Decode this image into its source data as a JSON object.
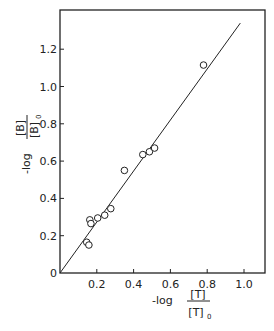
{
  "chart_data": {
    "type": "scatter",
    "title": "",
    "xlabel": "-log [T]/[T]0",
    "ylabel": "-log [B]/[B]0",
    "xlabel_parts": {
      "prefix": "-log",
      "numerator": "[T]",
      "denominator": "[T]",
      "subscript": "0"
    },
    "ylabel_parts": {
      "prefix": "-log",
      "numerator": "[B]",
      "denominator": "[B]",
      "subscript": "0"
    },
    "xlim": [
      0,
      1.1
    ],
    "ylim": [
      0,
      1.38
    ],
    "x_ticks": [
      0.2,
      0.4,
      0.6,
      0.8,
      1.0
    ],
    "x_tick_labels": [
      "0.2",
      "0.4",
      "0.6",
      "0.8",
      "1.0"
    ],
    "y_ticks": [
      0,
      0.2,
      0.4,
      0.6,
      0.8,
      1.0,
      1.2
    ],
    "y_tick_labels": [
      "0",
      "0.2",
      "0.4",
      "0.6",
      "0.8",
      "1.0",
      "1.2"
    ],
    "grid": false,
    "legend": null,
    "series": [
      {
        "name": "observed",
        "marker": "open-circle",
        "x": [
          0.145,
          0.157,
          0.162,
          0.168,
          0.205,
          0.243,
          0.276,
          0.35,
          0.45,
          0.486,
          0.514,
          0.78
        ],
        "y": [
          0.165,
          0.15,
          0.285,
          0.265,
          0.295,
          0.31,
          0.345,
          0.55,
          0.635,
          0.65,
          0.67,
          1.115
        ]
      },
      {
        "name": "fit line",
        "marker": "line",
        "x": [
          0,
          0.98
        ],
        "y": [
          0,
          1.34
        ]
      }
    ]
  }
}
